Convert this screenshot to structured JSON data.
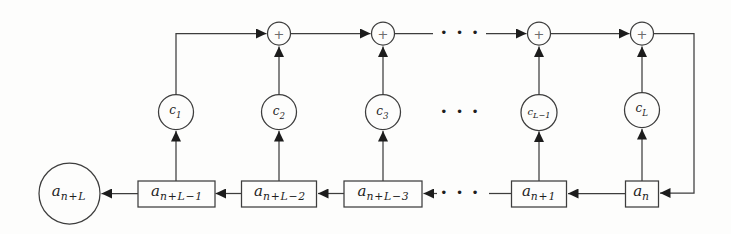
{
  "colors": {
    "background": "#fdfdfc",
    "line": "#3d3d3d",
    "text": "#1e1e1e",
    "plus": "#6e6e6e"
  },
  "nodes": {
    "output": {
      "base": "a",
      "sub": "n+L"
    },
    "registers": [
      {
        "base": "a",
        "sub": "n+L−1"
      },
      {
        "base": "a",
        "sub": "n+L−2"
      },
      {
        "base": "a",
        "sub": "n+L−3"
      },
      {
        "base": "a",
        "sub": "n+1"
      },
      {
        "base": "a",
        "sub": "n"
      }
    ],
    "multipliers": [
      {
        "base": "c",
        "sub": "1"
      },
      {
        "base": "c",
        "sub": "2"
      },
      {
        "base": "c",
        "sub": "3"
      },
      {
        "base": "c",
        "sub": "L−1"
      },
      {
        "base": "c",
        "sub": "L"
      }
    ],
    "adder_label": "+",
    "ellipsis": "···"
  }
}
